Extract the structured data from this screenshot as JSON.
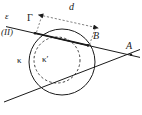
{
  "figure": {
    "background_color": "#ffffff",
    "stroke_color": "#1a1a1a",
    "labels": {
      "line_epsilon": "ε",
      "point_gamma": "Γ",
      "plane_note": "(ΙΙ)",
      "distance_d": "d",
      "point_B": "B",
      "point_A": "A",
      "circle_kappa": "κ",
      "circle_kappa_prime": "κ′"
    },
    "geometry": {
      "outer_circle": {
        "name": "κ",
        "cx": 62,
        "cy": 62,
        "r": 33,
        "style": "solid"
      },
      "inner_circle": {
        "name": "κ′",
        "cx": 57,
        "cy": 60,
        "r": 23,
        "style": "dashed"
      },
      "secant_line": {
        "name": "ε",
        "from": [
          8,
          27
        ],
        "to": [
          138,
          57
        ],
        "intersections": [
          "Γ",
          "B"
        ]
      },
      "point_gamma": {
        "x": 35,
        "y": 33
      },
      "point_B": {
        "x": 88,
        "y": 45
      },
      "point_A": {
        "x": 131,
        "y": 55
      },
      "tangent_line": {
        "from": [
          6,
          101
        ],
        "to": [
          138,
          50
        ]
      },
      "dimension_d": {
        "label": "d",
        "from": [
          41,
          14
        ],
        "to": [
          97,
          27
        ],
        "style": "dashed",
        "arrowheads": "both"
      }
    }
  }
}
